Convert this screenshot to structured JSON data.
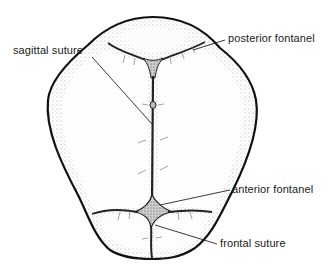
{
  "diagram": {
    "labels": {
      "sagittal_suture": "sagittal suture",
      "posterior_fontanel": "posterior fontanel",
      "anterior_fontanel": "anterior fontanel",
      "frontal_suture": "frontal suture"
    }
  }
}
